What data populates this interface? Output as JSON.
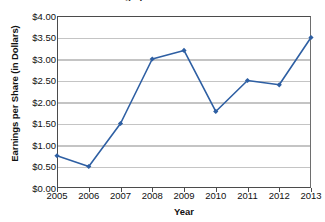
{
  "chart_data": {
    "type": "line",
    "title": "Earnings per Share 2005-2013",
    "xlabel": "Year",
    "ylabel": "Earnings per Share (in Dollars)",
    "categories": [
      "2005",
      "2006",
      "2007",
      "2008",
      "2009",
      "2010",
      "2011",
      "2012",
      "2013"
    ],
    "values": [
      0.75,
      0.5,
      1.5,
      3.0,
      3.2,
      1.78,
      2.5,
      2.4,
      3.5
    ],
    "series": [
      {
        "name": "Earnings per Share",
        "values": [
          0.75,
          0.5,
          1.5,
          3.0,
          3.2,
          1.78,
          2.5,
          2.4,
          3.5
        ]
      }
    ],
    "ylim": [
      0,
      4
    ],
    "ytick_step": 0.5,
    "ytick_labels": [
      "$0.00",
      "$0.50",
      "$1.00",
      "$1.50",
      "$2.00",
      "$2.50",
      "$3.00",
      "$3.50",
      "$4.00"
    ],
    "ytick_values": [
      0,
      0.5,
      1,
      1.5,
      2,
      2.5,
      3,
      3.5,
      4
    ],
    "xtick_labels": [
      "2005",
      "2006",
      "2007",
      "2008",
      "2009",
      "2010",
      "2011",
      "2012",
      "2013"
    ],
    "grid": "horizontal",
    "legend": "none",
    "marker": "filled-diamond",
    "line_color": "#2e5fa3",
    "marker_color": "#2e5fa3",
    "grid_color": "#c4c4c4",
    "axis_color": "#4b4b4b",
    "text_color": "#111111",
    "background_color": "#ffffff"
  }
}
